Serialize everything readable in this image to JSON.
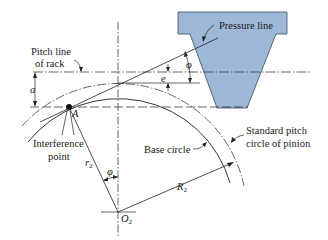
{
  "figure": {
    "colors": {
      "rack_fill": "#9db8d6",
      "rack_stroke": "#3a4a5a",
      "line": "#222222",
      "background": "#ffffff"
    },
    "labels": {
      "pressure_line": "Pressure line",
      "pitch_line_rack_1": "Pitch line",
      "pitch_line_rack_2": "of rack",
      "a": "a",
      "e": "e",
      "phi_top": "φ",
      "phi_bottom": "φ",
      "point_A": "A",
      "interference_1": "Interference",
      "interference_2": "point",
      "r2": "r",
      "r2_sub": "2",
      "base_circle": "Base circle",
      "std_pitch_1": "Standard pitch",
      "std_pitch_2": "circle of pinion",
      "R2": "R",
      "R2_sub": "2",
      "O2": "O",
      "O2_sub": "2"
    }
  }
}
